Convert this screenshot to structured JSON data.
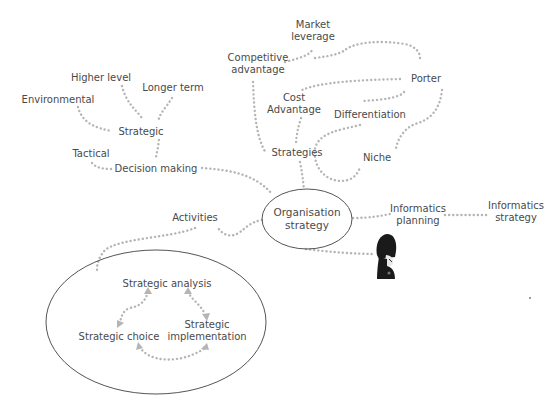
{
  "diagram": {
    "type": "mind-map",
    "central_node": {
      "label_line1": "Organisation",
      "label_line2": "strategy"
    },
    "nodes": {
      "market_leverage": {
        "line1": "Market",
        "line2": "leverage"
      },
      "competitive_advantage": {
        "line1": "Competitive",
        "line2": "advantage"
      },
      "porter": "Porter",
      "cost_advantage": {
        "line1": "Cost",
        "line2": "Advantage"
      },
      "differentiation": "Differentiation",
      "niche": "Niche",
      "strategies": "Strategies",
      "higher_level": "Higher level",
      "longer_term": "Longer term",
      "environmental": "Environmental",
      "strategic": "Strategic",
      "tactical": "Tactical",
      "decision_making": "Decision making",
      "activities": "Activities",
      "informatics_planning": {
        "line1": "Informatics",
        "line2": "planning"
      },
      "informatics_strategy": {
        "line1": "Informatics",
        "line2": "strategy"
      }
    },
    "cycle": {
      "strategic_analysis": "Strategic analysis",
      "strategic_choice": "Strategic choice",
      "strategic_implementation": {
        "line1": "Strategic",
        "line2": "implementation"
      }
    },
    "icons": {
      "guard": "royal-guard-icon"
    },
    "colors": {
      "link": "#b5b5b5",
      "text": "#4a4a4a",
      "ellipse": "#555555",
      "guard": "#1a1a1a"
    }
  }
}
